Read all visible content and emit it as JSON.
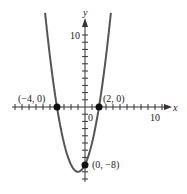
{
  "chart_data": {
    "type": "line",
    "title": "",
    "function": "y = x^2 + 2x - 8",
    "xlabel": "x",
    "ylabel": "y",
    "xlim": [
      -12,
      12
    ],
    "ylim": [
      -10,
      12
    ],
    "grid": false,
    "tick_step": 1,
    "tick_labels": {
      "x": [
        "10"
      ],
      "y": [
        "10"
      ],
      "origin": "0"
    },
    "series": [
      {
        "name": "parabola",
        "color": "#555555",
        "x": [
          -5.6,
          -5,
          -4,
          -3,
          -2,
          -1,
          0,
          1,
          2,
          3,
          3.6
        ],
        "y": [
          10.2,
          7,
          0,
          -5,
          -8,
          -9,
          -8,
          -5,
          0,
          7,
          12.2
        ]
      }
    ],
    "points": [
      {
        "x": -4,
        "y": 0,
        "label": "(−4, 0)"
      },
      {
        "x": 2,
        "y": 0,
        "label": "(2, 0)"
      },
      {
        "x": 0,
        "y": -8,
        "label": "(0, −8)"
      }
    ]
  },
  "labels": {
    "x_axis": "x",
    "y_axis": "y",
    "origin": "0",
    "x_ten": "10",
    "y_ten": "10",
    "p1": "(−4, 0)",
    "p2": "(2, 0)",
    "p3": "(0, −8)"
  }
}
